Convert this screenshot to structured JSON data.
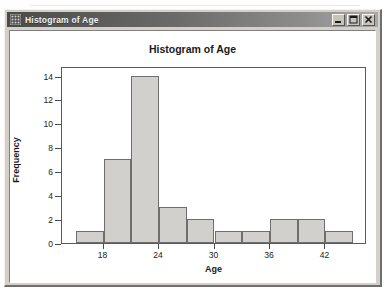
{
  "window": {
    "title": "Histogram of Age",
    "icon": "grid-window-icon",
    "buttons": [
      {
        "name": "minimize-button",
        "label": "_"
      },
      {
        "name": "maximize-button",
        "label": "□"
      },
      {
        "name": "close-button",
        "label": "×"
      }
    ]
  },
  "chart_data": {
    "type": "bar",
    "title": "Histogram of Age",
    "xlabel": "Age",
    "ylabel": "Frequency",
    "subtitle": "",
    "grid": false,
    "legend_position": "none",
    "bin_width": 3,
    "bin_edges": [
      15,
      18,
      21,
      24,
      27,
      30,
      33,
      36,
      39,
      42,
      45
    ],
    "categories": [
      "15-18",
      "18-21",
      "21-24",
      "24-27",
      "27-30",
      "30-33",
      "33-36",
      "36-39",
      "39-42",
      "42-45"
    ],
    "values": [
      1,
      7,
      14,
      3,
      2,
      1,
      1,
      2,
      2,
      1
    ],
    "xlim": [
      13.5,
      46.5
    ],
    "ylim": [
      0,
      14.8
    ],
    "xticks": [
      18,
      24,
      30,
      36,
      42
    ],
    "xtick_labels": [
      "18",
      "24",
      "30",
      "36",
      "42"
    ],
    "yticks": [
      0,
      2,
      4,
      6,
      8,
      10,
      12,
      14
    ],
    "ytick_labels": [
      "0",
      "2",
      "4",
      "6",
      "8",
      "10",
      "12",
      "14"
    ],
    "colors": {
      "bar_fill": "#d2d0cc",
      "bar_edge": "#6e6e6e",
      "axis": "#5a5a5a",
      "plot_background": "#ffffff"
    }
  }
}
